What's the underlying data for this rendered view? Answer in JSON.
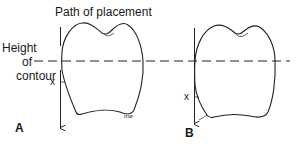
{
  "labels": {
    "path_of_placement": "Path of placement",
    "height_of_contour_line1": "Height",
    "height_of_contour_line2": "of",
    "height_of_contour_line3": "contour",
    "x_marker_a": "x",
    "x_marker_b": "x",
    "panel_a": "A",
    "panel_b": "B",
    "signature": "mø"
  },
  "colors": {
    "line": "#222222",
    "background": "#ffffff"
  }
}
